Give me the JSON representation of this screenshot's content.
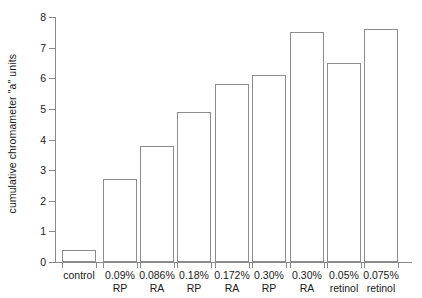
{
  "chart_data": {
    "type": "bar",
    "title": "",
    "xlabel": "",
    "ylabel": "cumulative chromameter \"a\" units",
    "ylim": [
      0,
      8
    ],
    "yticks": [
      0,
      1,
      2,
      3,
      4,
      5,
      6,
      7,
      8
    ],
    "ytick_labels": [
      "0",
      "1",
      "2",
      "3",
      "4",
      "5",
      "6",
      "7",
      "8"
    ],
    "grid": false,
    "legend": "none",
    "categories": [
      "control",
      "0.09%\nRP",
      "0.086%\nRA",
      "0.18%\nRP",
      "0.172%\nRA",
      "0.30%\nRP",
      "0.30%\nRA",
      "0.05%\nretinol",
      "0.075%\nretinol"
    ],
    "values": [
      0.4,
      2.7,
      3.8,
      4.9,
      5.8,
      6.1,
      7.5,
      6.5,
      7.6
    ],
    "bar_fill_color": "#ffffff",
    "bar_edge_color": "#8c8c8c",
    "axis_color": "#8a8a8a",
    "text_color": "#1a1a1a",
    "background_color": "#ffffff"
  }
}
